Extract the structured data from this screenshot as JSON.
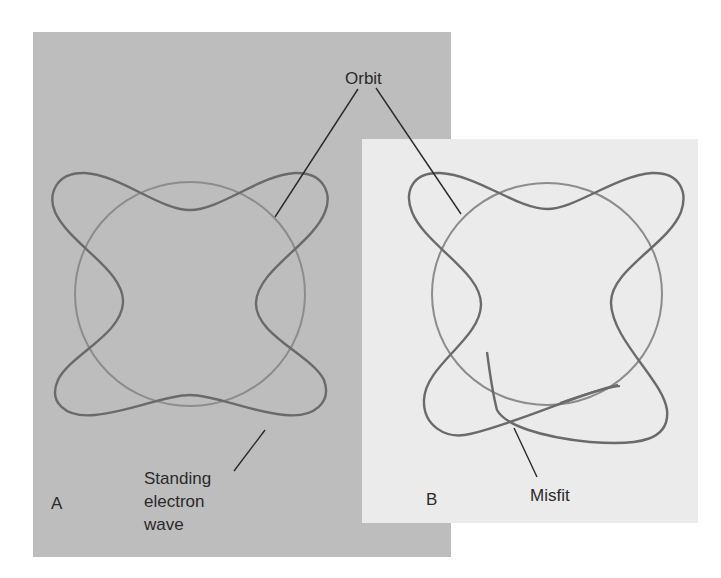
{
  "figure": {
    "panels": [
      {
        "id": "A",
        "label": "A",
        "background": "#bdbdbd",
        "description": "Standing electron wave fits the orbit"
      },
      {
        "id": "B",
        "label": "B",
        "background": "#ebebeb",
        "description": "Wave does not close on itself"
      }
    ],
    "labels": {
      "orbit": "Orbit",
      "standing_line1": "Standing",
      "standing_line2": "electron",
      "standing_line3": "wave",
      "misfit": "Misfit"
    },
    "colors": {
      "page": "#ffffff",
      "panel_a": "#bdbdbd",
      "panel_b": "#ebebeb",
      "wave": "#6a6a6a",
      "orbit": "#8c8c8c",
      "leader": "#2a2a2a",
      "text": "#2a2a2a"
    }
  }
}
